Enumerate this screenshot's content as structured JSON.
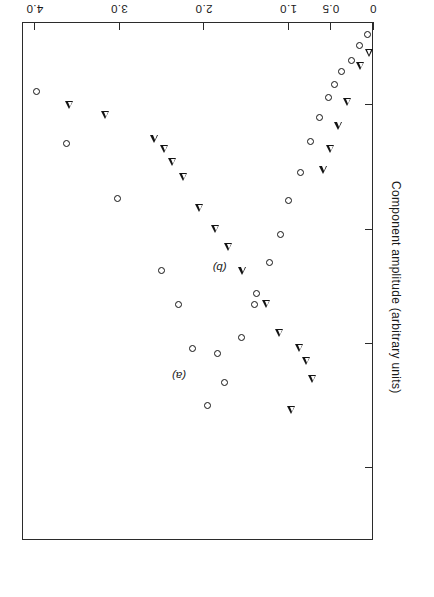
{
  "chart_data": {
    "type": "scatter",
    "title": "",
    "xlabel": "Frequency (MHz)",
    "ylabel": "Component amplitude (arbitrary units)",
    "xlim": [
      0,
      4.15
    ],
    "ylim": [
      0,
      1.0
    ],
    "grid": false,
    "legend_position": "inline-annotations",
    "xticks": [
      {
        "value": 0,
        "label": "0"
      },
      {
        "value": 0.5,
        "label": "0.5"
      },
      {
        "value": 1.0,
        "label": "1.0"
      },
      {
        "value": 2.0,
        "label": "2.0"
      },
      {
        "value": 3.0,
        "label": "3.0"
      },
      {
        "value": 4.0,
        "label": "4.0"
      }
    ],
    "yticks": [
      {
        "value": 0.16,
        "label": ""
      },
      {
        "value": 0.4,
        "label": ""
      },
      {
        "value": 0.62,
        "label": ""
      },
      {
        "value": 0.86,
        "label": ""
      }
    ],
    "annotations": [
      {
        "text": "(a)",
        "x": 2.14,
        "y": 0.665,
        "series": "a"
      },
      {
        "text": "(b)",
        "x": 1.66,
        "y": 0.455,
        "series": "b"
      }
    ],
    "series": [
      {
        "name": "(a)",
        "marker": "circle",
        "points": [
          {
            "x": 0.06,
            "y": 0.025
          },
          {
            "x": 0.16,
            "y": 0.045
          },
          {
            "x": 0.26,
            "y": 0.075
          },
          {
            "x": 0.37,
            "y": 0.095
          },
          {
            "x": 0.46,
            "y": 0.12
          },
          {
            "x": 0.53,
            "y": 0.145
          },
          {
            "x": 0.63,
            "y": 0.185
          },
          {
            "x": 0.74,
            "y": 0.23
          },
          {
            "x": 0.86,
            "y": 0.29
          },
          {
            "x": 1.0,
            "y": 0.345
          },
          {
            "x": 1.09,
            "y": 0.41
          },
          {
            "x": 1.22,
            "y": 0.465
          },
          {
            "x": 1.38,
            "y": 0.525
          },
          {
            "x": 1.4,
            "y": 0.545
          },
          {
            "x": 1.56,
            "y": 0.61
          },
          {
            "x": 1.76,
            "y": 0.695
          },
          {
            "x": 1.84,
            "y": 0.64
          },
          {
            "x": 1.96,
            "y": 0.74
          },
          {
            "x": 2.14,
            "y": 0.63
          },
          {
            "x": 2.3,
            "y": 0.545
          },
          {
            "x": 2.5,
            "y": 0.48
          },
          {
            "x": 3.02,
            "y": 0.34
          },
          {
            "x": 3.62,
            "y": 0.235
          },
          {
            "x": 3.98,
            "y": 0.135
          }
        ]
      },
      {
        "name": "(b)",
        "marker": "triangle",
        "points": [
          {
            "x": 0.06,
            "y": 0.06
          },
          {
            "x": 0.16,
            "y": 0.085
          },
          {
            "x": 0.31,
            "y": 0.155
          },
          {
            "x": 0.42,
            "y": 0.2
          },
          {
            "x": 0.52,
            "y": 0.245
          },
          {
            "x": 0.6,
            "y": 0.285
          },
          {
            "x": 0.73,
            "y": 0.69
          },
          {
            "x": 0.8,
            "y": 0.655
          },
          {
            "x": 0.88,
            "y": 0.63
          },
          {
            "x": 0.98,
            "y": 0.75
          },
          {
            "x": 1.12,
            "y": 0.6
          },
          {
            "x": 1.27,
            "y": 0.545
          },
          {
            "x": 1.56,
            "y": 0.48
          },
          {
            "x": 1.72,
            "y": 0.435
          },
          {
            "x": 1.87,
            "y": 0.4
          },
          {
            "x": 2.06,
            "y": 0.36
          },
          {
            "x": 2.25,
            "y": 0.3
          },
          {
            "x": 2.38,
            "y": 0.27
          },
          {
            "x": 2.48,
            "y": 0.245
          },
          {
            "x": 2.6,
            "y": 0.225
          },
          {
            "x": 3.18,
            "y": 0.18
          },
          {
            "x": 3.6,
            "y": 0.16
          }
        ]
      }
    ]
  }
}
